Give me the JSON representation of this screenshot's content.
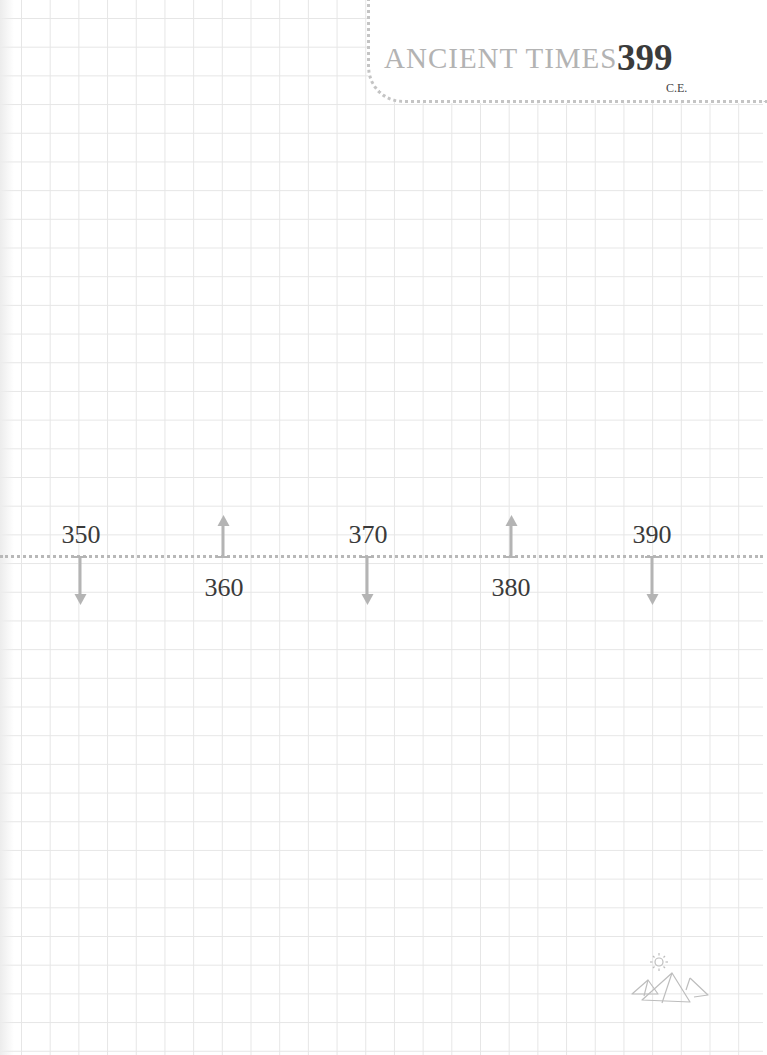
{
  "header": {
    "title": "ANCIENT TIMES",
    "year": "399",
    "era": "C.E."
  },
  "timeline": {
    "ticks": [
      {
        "label": "350",
        "x": 81,
        "direction": "down"
      },
      {
        "label": "360",
        "x": 223,
        "direction": "up"
      },
      {
        "label": "370",
        "x": 367,
        "direction": "down"
      },
      {
        "label": "380",
        "x": 511,
        "direction": "up"
      },
      {
        "label": "390",
        "x": 652,
        "direction": "down"
      }
    ]
  },
  "decorations": {
    "corner_icon": "pyramids-with-sun-icon"
  },
  "colors": {
    "grid": "#e6e6e6",
    "title": "#b3b3b3",
    "year": "#3b3b3b",
    "arrow": "#b4b4b4",
    "dots": "#c4c4c4"
  }
}
